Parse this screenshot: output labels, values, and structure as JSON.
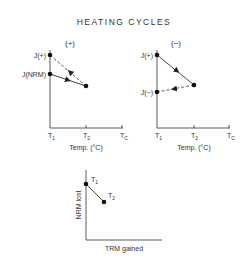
{
  "title": "HEATING CYCLES",
  "plots": {
    "left": {
      "sign": "(+)",
      "y_labels": {
        "j_plus": "J(+)",
        "j_nrm": "J(NRM)"
      },
      "x_ticks": {
        "t1": "T",
        "t1_sub": "1",
        "t2": "T",
        "t2_sub": "2",
        "tc": "T",
        "tc_sub": "C"
      },
      "xlabel": "Temp. (°C)"
    },
    "right": {
      "sign": "(−)",
      "y_labels": {
        "j_plus": "J(+)",
        "j_minus": "J(−)"
      },
      "x_ticks": {
        "t1": "T",
        "t1_sub": "1",
        "t2": "T",
        "t2_sub": "2",
        "tc": "T",
        "tc_sub": "C"
      },
      "xlabel": "Temp. (°C)"
    },
    "bottom": {
      "ylabel": "NRM lost",
      "xlabel": "TRM gained",
      "points": {
        "t1": "T",
        "t1_sub": "1",
        "t2": "T",
        "t2_sub": "2"
      }
    }
  },
  "colors": {
    "ink": "#222222",
    "background": "#ffffff"
  }
}
